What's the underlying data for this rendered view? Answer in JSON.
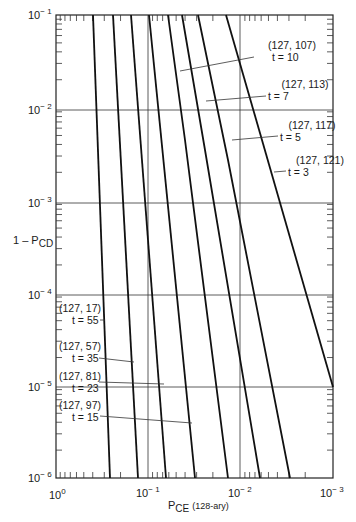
{
  "chart_data": {
    "type": "line",
    "title": "",
    "xlabel": "P_CE (128-ary)",
    "ylabel": "1 - P_CD",
    "x_scale": "log",
    "y_scale": "log",
    "xlim": [
      1,
      0.001
    ],
    "ylim": [
      1e-06,
      0.1
    ],
    "x_reversed": true,
    "grid": "decades",
    "x_ticks": [
      "10^0",
      "10^-1",
      "10^-2",
      "10^-3"
    ],
    "y_ticks": [
      "10^-1",
      "10^-2",
      "10^-3",
      "10^-4",
      "10^-5",
      "10^-6"
    ],
    "series": [
      {
        "name": "(127, 17) t = 55",
        "code": "(127, 17)",
        "t": "t = 55",
        "points": [
          [
            0.4,
            0.1
          ],
          [
            0.26,
            1e-06
          ]
        ]
      },
      {
        "name": "(127, 57) t = 35",
        "code": "(127, 57)",
        "t": "t = 35",
        "points": [
          [
            0.25,
            0.1
          ],
          [
            0.14,
            1e-06
          ]
        ]
      },
      {
        "name": "(127, 81) t = 23",
        "code": "(127, 81)",
        "t": "t = 23",
        "points": [
          [
            0.16,
            0.1
          ],
          [
            0.072,
            1e-06
          ]
        ]
      },
      {
        "name": "(127, 97) t = 15",
        "code": "(127, 97)",
        "t": "t = 15",
        "points": [
          [
            0.101,
            0.1
          ],
          [
            0.034,
            1e-06
          ]
        ]
      },
      {
        "name": "(127, 107) t = 10",
        "code": "(127, 107)",
        "t": "t = 10",
        "points": [
          [
            0.062,
            0.1
          ],
          [
            0.015,
            1e-06
          ]
        ]
      },
      {
        "name": "(127, 113) t = 7",
        "code": "(127, 113)",
        "t": "t = 7",
        "points": [
          [
            0.044,
            0.1
          ],
          [
            0.0068,
            1e-06
          ]
        ]
      },
      {
        "name": "(127, 117) t = 5",
        "code": "(127, 117)",
        "t": "t = 5",
        "points": [
          [
            0.029,
            0.1
          ],
          [
            0.0032,
            1e-06
          ]
        ]
      },
      {
        "name": "(127, 121) t = 3",
        "code": "(127, 121)",
        "t": "t = 3",
        "points": [
          [
            0.015,
            0.1
          ],
          [
            0.001,
            1e-05
          ]
        ]
      }
    ]
  },
  "axes": {
    "ylabel_main": "1 – P",
    "ylabel_sub": "CD",
    "xlabel_main": "P",
    "xlabel_sub": "CE",
    "xlabel_suffix": "(128-ary)",
    "x_tick_base": "10",
    "x_tick_exps": [
      "0",
      "− 1",
      "− 2",
      "− 3"
    ],
    "y_tick_base": "10",
    "y_tick_exps": [
      "− 1",
      "− 2",
      "− 3",
      "− 4",
      "− 5",
      "− 6"
    ]
  },
  "labels": [
    {
      "code": "(127, 107)",
      "t": "t = 10"
    },
    {
      "code": "(127, 113)",
      "t": "t = 7"
    },
    {
      "code": "(127, 117)",
      "t": "t = 5"
    },
    {
      "code": "(127, 121)",
      "t": "t = 3"
    },
    {
      "code": "(127, 17)",
      "t": "t = 55"
    },
    {
      "code": "(127, 57)",
      "t": "t = 35"
    },
    {
      "code": "(127, 81)",
      "t": "t = 23"
    },
    {
      "code": "(127, 97)",
      "t": "t = 15"
    }
  ]
}
